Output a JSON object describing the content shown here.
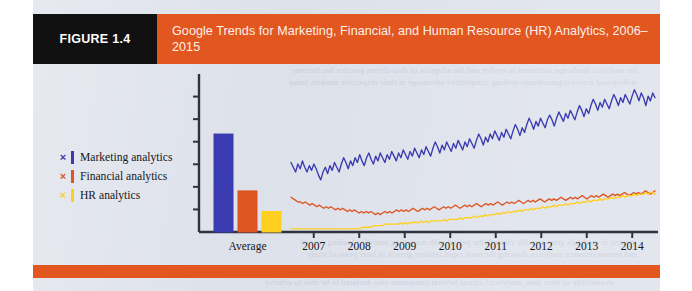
{
  "figure": {
    "tag": "FIGURE 1.4",
    "title": "Google Trends for Marketing, Financial, and Human Resource (HR) Analytics, 2006–2015",
    "tag_bg": "#111111",
    "header_bg": "#e2561f",
    "page_bg": "#dde1ea"
  },
  "legend": {
    "items": [
      {
        "marker": "×",
        "label": "Marketing analytics",
        "color": "#3b3bb0"
      },
      {
        "marker": "×",
        "label": "Financial analytics",
        "color": "#dd5522"
      },
      {
        "marker": "×",
        "label": "HR analytics",
        "color": "#ffcf1f"
      }
    ]
  },
  "showthrough": {
    "top": "the analytics landscape continues to evolve and the adoption of data‐driven practice has become\nwidespread across organizations seeking competitive advantage in their respective markets today",
    "bottom": "interest in analytics grew steadily through the period with marketing analytics leading overall\nand human resource analytics showing the most rapid relative growth in later years of study",
    "under": "availability of their data, analytics Critical Several companies also declared to be able to achieve"
  },
  "chart_data": {
    "type": "line",
    "title": "Google Trends for Marketing, Financial, and Human Resource (HR) Analytics, 2006–2015",
    "xlabel": "",
    "ylabel": "",
    "grid": false,
    "legend_position": "left",
    "axis": {
      "y_ticks_count": 6,
      "y_tick_labels": [],
      "ylim": [
        0,
        100
      ],
      "x_tick_labels": [
        "Average",
        "2007",
        "2008",
        "2009",
        "2010",
        "2011",
        "2012",
        "2013",
        "2014"
      ]
    },
    "bar_panel": {
      "type": "bar",
      "category": "Average",
      "series": [
        "Marketing analytics",
        "Financial analytics",
        "HR analytics"
      ],
      "values": [
        62,
        26,
        13
      ],
      "colors": [
        "#3b3bb0",
        "#dd5522",
        "#ffcf1f"
      ]
    },
    "series": [
      {
        "name": "Marketing analytics",
        "color": "#3b3bb0",
        "values": [
          44,
          41,
          38,
          43,
          40,
          45,
          41,
          38,
          42,
          39,
          43,
          40,
          36,
          33,
          38,
          41,
          37,
          42,
          39,
          44,
          41,
          38,
          43,
          47,
          44,
          40,
          45,
          42,
          47,
          44,
          49,
          45,
          42,
          47,
          50,
          46,
          43,
          48,
          45,
          50,
          47,
          44,
          49,
          46,
          51,
          48,
          45,
          50,
          47,
          52,
          49,
          46,
          51,
          48,
          53,
          50,
          47,
          52,
          49,
          54,
          51,
          48,
          53,
          57,
          54,
          50,
          55,
          52,
          57,
          54,
          51,
          56,
          53,
          58,
          55,
          52,
          57,
          54,
          59,
          56,
          53,
          58,
          62,
          59,
          55,
          60,
          57,
          62,
          59,
          64,
          61,
          58,
          63,
          60,
          65,
          62,
          59,
          64,
          68,
          65,
          61,
          66,
          63,
          68,
          72,
          69,
          65,
          70,
          67,
          72,
          69,
          66,
          71,
          74,
          71,
          67,
          72,
          76,
          73,
          70,
          75,
          72,
          77,
          74,
          71,
          76,
          80,
          77,
          73,
          78,
          75,
          80,
          84,
          81,
          77,
          82,
          79,
          84,
          81,
          78,
          83,
          87,
          84,
          80,
          85,
          82,
          87,
          84,
          81,
          86,
          90,
          87,
          83,
          88,
          85,
          80,
          86,
          83,
          88,
          85
        ]
      },
      {
        "name": "Financial analytics",
        "color": "#dd5522",
        "values": [
          22,
          21,
          20,
          19,
          19,
          18,
          19,
          18,
          17,
          18,
          17,
          16,
          17,
          16,
          15,
          16,
          15,
          16,
          15,
          14,
          15,
          14,
          15,
          14,
          13,
          14,
          13,
          14,
          13,
          12,
          13,
          12,
          13,
          12,
          13,
          12,
          11,
          12,
          11,
          12,
          13,
          12,
          13,
          12,
          13,
          14,
          13,
          14,
          13,
          14,
          13,
          14,
          15,
          14,
          13,
          14,
          15,
          14,
          15,
          14,
          15,
          16,
          15,
          14,
          15,
          16,
          15,
          16,
          15,
          16,
          17,
          16,
          15,
          16,
          17,
          16,
          17,
          16,
          17,
          18,
          17,
          16,
          17,
          18,
          17,
          18,
          17,
          18,
          19,
          18,
          17,
          18,
          19,
          18,
          19,
          18,
          19,
          20,
          19,
          18,
          19,
          20,
          19,
          20,
          19,
          20,
          21,
          20,
          19,
          20,
          21,
          20,
          21,
          20,
          21,
          22,
          21,
          20,
          21,
          22,
          21,
          22,
          21,
          22,
          23,
          22,
          21,
          22,
          23,
          22,
          23,
          22,
          23,
          24,
          23,
          22,
          23,
          24,
          23,
          24,
          23,
          24,
          25,
          24,
          23,
          24,
          25,
          24,
          25,
          24,
          25,
          26,
          25,
          24,
          25,
          26
        ]
      },
      {
        "name": "HR analytics",
        "color": "#ffcf1f",
        "values": [
          2,
          2,
          2,
          2,
          2,
          2,
          2,
          2,
          2,
          2,
          2,
          2,
          2,
          2,
          2,
          2,
          2,
          2,
          2,
          2,
          2,
          2,
          2,
          2,
          2,
          2,
          2,
          2,
          2,
          2,
          2,
          3,
          3,
          3,
          3,
          3,
          4,
          4,
          4,
          4,
          4,
          5,
          5,
          5,
          5,
          5,
          5,
          5,
          6,
          5,
          6,
          5,
          6,
          6,
          6,
          6,
          6,
          7,
          6,
          7,
          6,
          7,
          7,
          7,
          7,
          7,
          7,
          8,
          7,
          8,
          8,
          8,
          8,
          8,
          9,
          8,
          9,
          9,
          9,
          9,
          10,
          9,
          10,
          10,
          10,
          11,
          10,
          11,
          11,
          11,
          12,
          11,
          12,
          12,
          12,
          13,
          12,
          13,
          13,
          13,
          14,
          13,
          14,
          14,
          14,
          15,
          14,
          15,
          15,
          15,
          16,
          15,
          16,
          16,
          16,
          17,
          16,
          17,
          17,
          17,
          18,
          17,
          18,
          18,
          18,
          19,
          18,
          19,
          19,
          19,
          20,
          19,
          20,
          20,
          20,
          21,
          20,
          21,
          21,
          21,
          22,
          21,
          22,
          22,
          22,
          23,
          22,
          23,
          23,
          23,
          24,
          23,
          24,
          24,
          24,
          25,
          24,
          25,
          25,
          24
        ]
      }
    ]
  }
}
